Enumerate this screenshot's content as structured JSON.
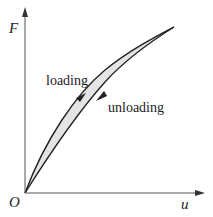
{
  "diagram": {
    "type": "hysteresis-loop",
    "axes": {
      "y_label": "F",
      "x_label": "u",
      "origin_label": "O"
    },
    "curves": {
      "loading_label": "loading",
      "unloading_label": "unloading"
    },
    "colors": {
      "line": "#222222",
      "fill": "#e4e4e4",
      "background": "#ffffff"
    }
  }
}
